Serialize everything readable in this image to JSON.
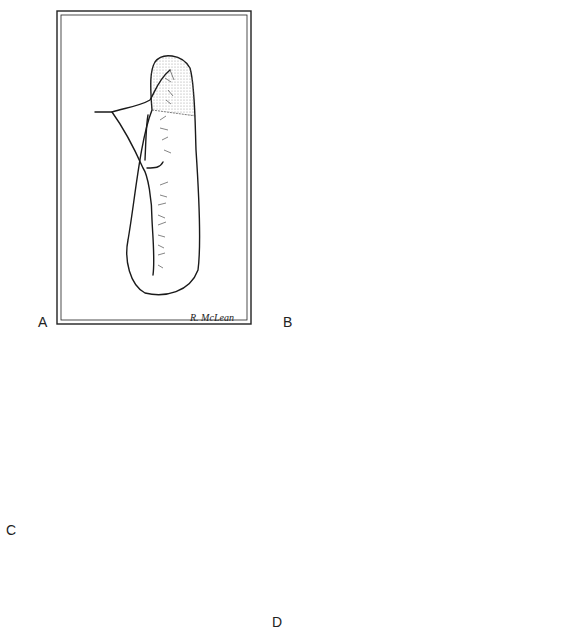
{
  "figure": {
    "panels": [
      {
        "id": "A",
        "label": "A",
        "description": "Schematic of flap with vascular supply, stippled distal tip"
      },
      {
        "id": "B",
        "label": "B",
        "description": "Flap with vessels ligated, clamp applied across base"
      },
      {
        "id": "C",
        "label": "C",
        "description": "Flap elevated, clamp with tissue cuff below"
      },
      {
        "id": "D",
        "label": "D",
        "description": "Clamped stump oversewn with crisscross suture"
      }
    ],
    "signature": "R. McLean",
    "colors": {
      "ink": "#1a1a1a",
      "background": "#ffffff",
      "stipple": "#999999"
    }
  }
}
